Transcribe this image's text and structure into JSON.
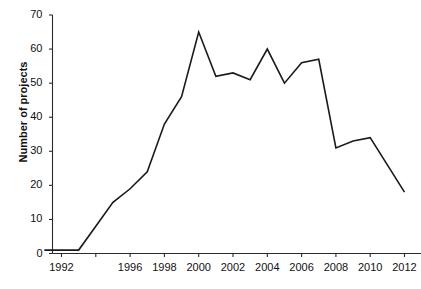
{
  "chart_data": {
    "type": "line",
    "title": "",
    "xlabel": "",
    "ylabel": "Number of projects",
    "xlim": [
      1991,
      2013
    ],
    "ylim": [
      0,
      70
    ],
    "grid": false,
    "legend": null,
    "ytick_values": [
      0,
      10,
      20,
      30,
      40,
      50,
      60,
      70
    ],
    "ytick_labels": [
      "0",
      "10",
      "20",
      "30",
      "40",
      "50",
      "60",
      "70"
    ],
    "xtick_values": [
      1992,
      1994,
      1996,
      1998,
      2000,
      2002,
      2004,
      2006,
      2008,
      2010,
      2012
    ],
    "xtick_labels": [
      "1992",
      "",
      "1996",
      "1998",
      "2000",
      "2002",
      "2004",
      "2006",
      "2008",
      "2010",
      "2012"
    ],
    "x": [
      1991,
      1992,
      1993,
      1994,
      1995,
      1996,
      1997,
      1998,
      1999,
      2000,
      2001,
      2002,
      2003,
      2004,
      2005,
      2006,
      2007,
      2008,
      2009,
      2010,
      2011,
      2012
    ],
    "values": [
      1,
      1,
      1,
      8,
      15,
      19,
      24,
      38,
      46,
      65,
      52,
      53,
      51,
      60,
      50,
      56,
      57,
      31,
      33,
      34,
      26,
      18
    ],
    "series": [
      {
        "name": "Number of projects",
        "color": "#1a1a1a",
        "values": [
          1,
          1,
          1,
          8,
          15,
          19,
          24,
          38,
          46,
          65,
          52,
          53,
          51,
          60,
          50,
          56,
          57,
          31,
          33,
          34,
          26,
          18
        ]
      }
    ]
  },
  "axes": {
    "y_title": "Number of projects"
  }
}
